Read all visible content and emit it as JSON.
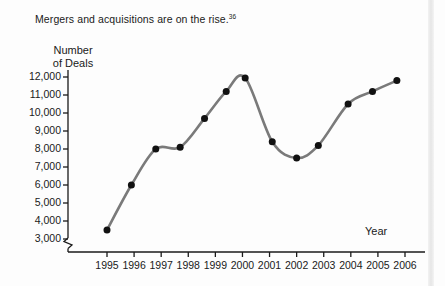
{
  "figure": {
    "caption": "Mergers and acquisitions are on the rise.",
    "footnote_marker": "36",
    "year_axis_label": "Year",
    "y_axis_title_line1": "Number",
    "y_axis_title_line2": "of Deals",
    "axis_break": true
  },
  "colors": {
    "line": "#7a7a7a",
    "marker": "#111111",
    "axis": "#1a1a1a",
    "background": "#fdfdfd",
    "text": "#1a1a1a"
  },
  "chart_data": {
    "type": "line",
    "title": "Mergers and acquisitions are on the rise.",
    "xlabel": "Year",
    "ylabel": "Number of Deals",
    "xlim": [
      1994.5,
      2006
    ],
    "ylim": [
      2600,
      12400
    ],
    "grid": false,
    "legend": null,
    "y_ticks": [
      3000,
      4000,
      5000,
      6000,
      7000,
      8000,
      9000,
      10000,
      11000,
      12000
    ],
    "y_tick_labels": [
      "3,000",
      "4,000",
      "5,000",
      "6,000",
      "7,000",
      "8,000",
      "9,000",
      "10,000",
      "11,000",
      "12,000"
    ],
    "x_ticks": [
      1995,
      1996,
      1997,
      1998,
      1999,
      2000,
      2001,
      2002,
      2003,
      2004,
      2005,
      2006
    ],
    "x_tick_labels": [
      "1995",
      "1996",
      "1997",
      "1998",
      "1999",
      "2000",
      "2001",
      "2002",
      "2003",
      "2004",
      "2005",
      "2006"
    ],
    "marker_style": "filled-circle",
    "points": [
      {
        "x": 1995.0,
        "y": 3500
      },
      {
        "x": 1995.9,
        "y": 6000
      },
      {
        "x": 1996.8,
        "y": 8000
      },
      {
        "x": 1997.7,
        "y": 8100
      },
      {
        "x": 1998.6,
        "y": 9700
      },
      {
        "x": 1999.4,
        "y": 11200
      },
      {
        "x": 2000.1,
        "y": 11950
      },
      {
        "x": 2001.1,
        "y": 8400
      },
      {
        "x": 2002.0,
        "y": 7500
      },
      {
        "x": 2002.8,
        "y": 8200
      },
      {
        "x": 2003.9,
        "y": 10500
      },
      {
        "x": 2004.8,
        "y": 11200
      },
      {
        "x": 2005.7,
        "y": 11800
      }
    ],
    "x": [
      1995.0,
      1995.9,
      1996.8,
      1997.7,
      1998.6,
      1999.4,
      2000.1,
      2001.1,
      2002.0,
      2002.8,
      2003.9,
      2004.8,
      2005.7
    ],
    "values": [
      3500,
      6000,
      8000,
      8100,
      9700,
      11200,
      11950,
      8400,
      7500,
      8200,
      10500,
      11200,
      11800
    ],
    "peak": {
      "x": 2000,
      "y": 11950
    },
    "trough": {
      "x": 2002,
      "y": 7500
    }
  }
}
